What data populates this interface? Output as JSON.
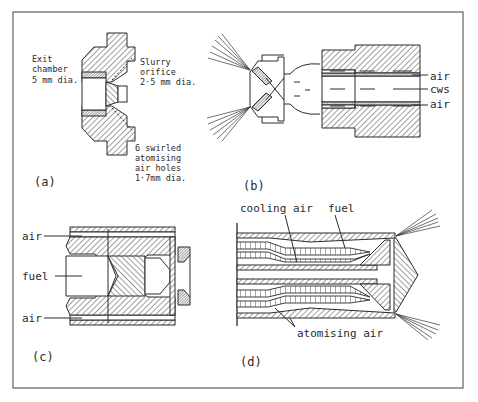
{
  "figure": {
    "frame_color": "#6e6e6e",
    "ink_color": "#2a2a2a",
    "background": "#ffffff"
  },
  "panels": {
    "a": {
      "tag": "(a)",
      "labels": {
        "exit_chamber": [
          "Exit",
          "chamber",
          "5 mm dia."
        ],
        "slurry_orifice": [
          "Slurry",
          "orifice",
          "2·5 mm dia."
        ],
        "swirl_holes": [
          "6 swirled",
          "atomising",
          "air holes",
          "1·7mm dia."
        ]
      }
    },
    "b": {
      "tag": "(b)",
      "labels": {
        "air_top": "air",
        "cws": "cws",
        "air_bottom": "air"
      }
    },
    "c": {
      "tag": "(c)",
      "labels": {
        "air_top": "air",
        "fuel": "fuel",
        "air_bottom": "air"
      }
    },
    "d": {
      "tag": "(d)",
      "labels": {
        "cooling_air": "cooling air",
        "fuel": "fuel",
        "atomising_air": "atomising air"
      }
    }
  }
}
